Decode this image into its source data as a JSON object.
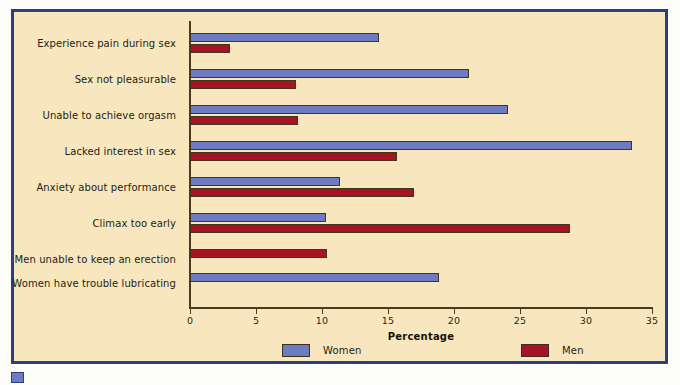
{
  "chart_data": {
    "type": "bar",
    "orientation": "horizontal",
    "title": "",
    "xlabel": "Percentage",
    "ylabel": "",
    "xlim": [
      0,
      35
    ],
    "xticks": [
      0,
      5,
      10,
      15,
      20,
      25,
      30,
      35
    ],
    "grid": false,
    "legend_position": "bottom",
    "categories": [
      "Experience pain during sex",
      "Sex not pleasurable",
      "Unable to achieve orgasm",
      "Lacked interest in sex",
      "Anxiety about performance",
      "Climax too early",
      "Men unable to keep an erection",
      "Women have trouble lubricating"
    ],
    "series": [
      {
        "name": "Women",
        "color": "#6d7cc0",
        "values": [
          14.3,
          21.1,
          24.1,
          33.5,
          11.4,
          10.3,
          null,
          18.9
        ]
      },
      {
        "name": "Men",
        "color": "#a61322",
        "values": [
          3.0,
          8.0,
          8.2,
          15.7,
          17.0,
          28.8,
          10.4,
          null
        ]
      }
    ]
  },
  "legend": {
    "items": [
      {
        "label": "Women",
        "color": "#6d7cc0"
      },
      {
        "label": "Men",
        "color": "#a61322"
      }
    ]
  },
  "axis": {
    "x_title": "Percentage",
    "tick_labels": [
      "0",
      "5",
      "10",
      "15",
      "20",
      "25",
      "30",
      "35"
    ]
  },
  "colors": {
    "background": "#f8e7be",
    "frame": "#2b3f80",
    "women": "#6d7cc0",
    "men": "#a61322",
    "axis": "#4a3a20",
    "text": "#221d12"
  }
}
